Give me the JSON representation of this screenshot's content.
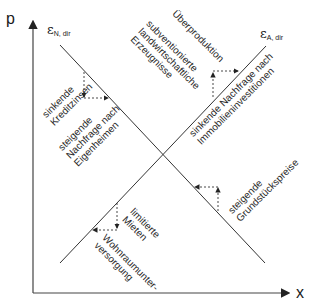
{
  "axes": {
    "y_label": "p",
    "x_label": "x"
  },
  "curves": {
    "demand": {
      "symbol": "ε",
      "subscript": "N, dir"
    },
    "supply": {
      "symbol": "ε",
      "subscript": "A, dir"
    }
  },
  "annotations": {
    "sinkende_kreditzinsen": [
      "sinkende",
      "Kreditzinsen"
    ],
    "steigende_nachfrage": [
      "steigende",
      "Nachfrage nach",
      "Eigenheimen"
    ],
    "ueberproduktion": [
      "Überproduktion",
      "subventionierte",
      "landwirtschaftliche",
      "Erzeugnisse"
    ],
    "sinkende_nachfrage": [
      "sinkende Nachfrage nach",
      "Immobilieninvestitionen"
    ],
    "steigende_grundstueckspreise": [
      "steigende",
      "Grundstückspreise"
    ],
    "limitierte_mieten": [
      "limitierte",
      "Mieten"
    ],
    "wohnraumunterversorgung": [
      "Wohnraumunter-",
      "versorgung"
    ]
  },
  "colors": {
    "line": "#333333",
    "axis": "#444444",
    "dashed": "#333333"
  }
}
